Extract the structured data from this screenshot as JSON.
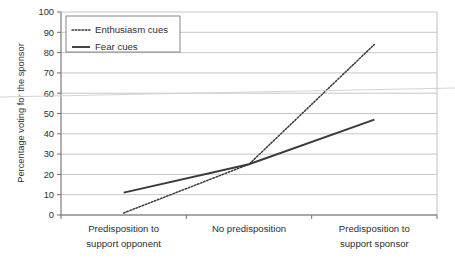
{
  "chart_data": {
    "type": "line",
    "title": "",
    "xlabel": "",
    "ylabel": "Percentage voting for the sponsor",
    "ylim": [
      0,
      100
    ],
    "ytick_step": 10,
    "yticks": [
      0,
      10,
      20,
      30,
      40,
      50,
      60,
      70,
      80,
      90,
      100
    ],
    "ytick_labels": [
      "0",
      "10",
      "20",
      "30",
      "40",
      "50",
      "60",
      "70",
      "80",
      "90",
      "100"
    ],
    "categories": [
      "Predisposition to support opponent",
      "No predisposition",
      "Predisposition to support sponsor"
    ],
    "category_lines": [
      [
        "Predisposition to",
        "support opponent"
      ],
      [
        "No predisposition",
        ""
      ],
      [
        "Predisposition to",
        "support sponsor"
      ]
    ],
    "series": [
      {
        "name": "Enthusiasm cues",
        "style": "dotted",
        "color": "#3a3a3a",
        "values": [
          1,
          25,
          84
        ]
      },
      {
        "name": "Fear cues",
        "style": "solid",
        "color": "#3a3a3a",
        "values": [
          11,
          25,
          47
        ]
      }
    ],
    "grid": true,
    "grid_axis": "y",
    "legend_position": "top-left"
  },
  "legend": {
    "items": [
      {
        "label": "Enthusiasm cues",
        "style": "dotted"
      },
      {
        "label": "Fear cues",
        "style": "solid"
      }
    ]
  },
  "colors": {
    "ink": "#3a3a3a",
    "grid": "#b9b9b9",
    "axis": "#6e6e6e",
    "background": "#ffffff"
  }
}
